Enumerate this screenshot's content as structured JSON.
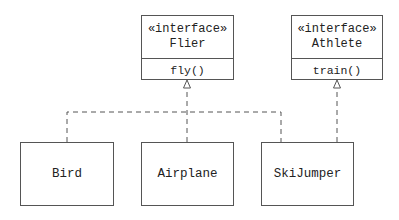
{
  "interfaces": [
    {
      "stereotype": "«interface»",
      "name": "Flier",
      "operation": "fly()"
    },
    {
      "stereotype": "«interface»",
      "name": "Athlete",
      "operation": "train()"
    }
  ],
  "classes": [
    {
      "name": "Bird"
    },
    {
      "name": "Airplane"
    },
    {
      "name": "SkiJumper"
    }
  ],
  "relations": [
    {
      "from": "Bird",
      "to": "Flier",
      "type": "realization"
    },
    {
      "from": "Airplane",
      "to": "Flier",
      "type": "realization"
    },
    {
      "from": "SkiJumper",
      "to": "Flier",
      "type": "realization"
    },
    {
      "from": "SkiJumper",
      "to": "Athlete",
      "type": "realization"
    }
  ]
}
